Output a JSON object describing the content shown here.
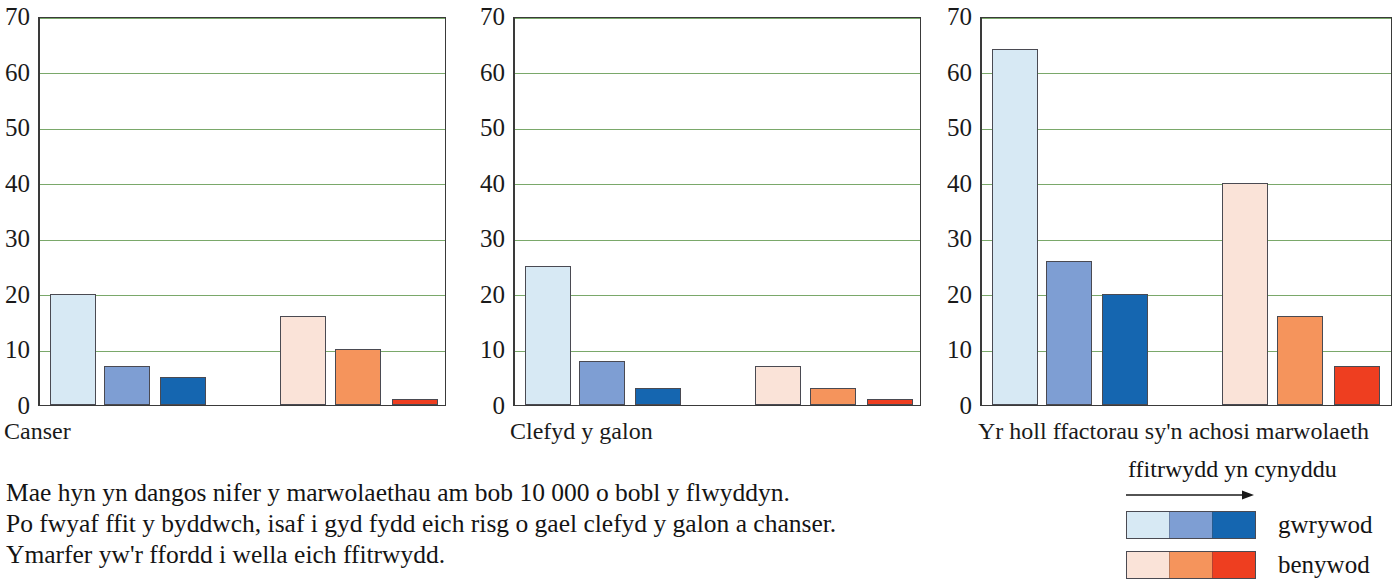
{
  "chart_data": [
    {
      "type": "bar",
      "title": "Canser",
      "xlabel": "",
      "ylabel": "",
      "ylim": [
        0,
        70
      ],
      "ytick_labels": [
        "70",
        "60",
        "50",
        "40",
        "30",
        "20",
        "10",
        "0"
      ],
      "yticks": [
        70,
        60,
        50,
        40,
        30,
        20,
        10,
        0
      ],
      "grid": true,
      "categories": [
        "gwrywod - ffitrwydd isel",
        "gwrywod - ffitrwydd canolig",
        "gwrywod - ffitrwydd uchel",
        "benywod - ffitrwydd isel",
        "benywod - ffitrwydd canolig",
        "benywod - ffitrwydd uchel"
      ],
      "series": [
        {
          "name": "gwrywod",
          "values": [
            20,
            7,
            5
          ]
        },
        {
          "name": "benywod",
          "values": [
            16,
            10,
            1
          ]
        }
      ],
      "values": [
        20,
        7,
        5,
        16,
        10,
        1
      ],
      "colors": [
        "#d7e9f4",
        "#7e9ed3",
        "#1566b0",
        "#fae3d8",
        "#f5945c",
        "#ee3e20"
      ]
    },
    {
      "type": "bar",
      "title": "Clefyd y galon",
      "xlabel": "",
      "ylabel": "",
      "ylim": [
        0,
        70
      ],
      "ytick_labels": [
        "70",
        "60",
        "50",
        "40",
        "30",
        "20",
        "10",
        "0"
      ],
      "yticks": [
        70,
        60,
        50,
        40,
        30,
        20,
        10,
        0
      ],
      "grid": true,
      "categories": [
        "gwrywod - ffitrwydd isel",
        "gwrywod - ffitrwydd canolig",
        "gwrywod - ffitrwydd uchel",
        "benywod - ffitrwydd isel",
        "benywod - ffitrwydd canolig",
        "benywod - ffitrwydd uchel"
      ],
      "series": [
        {
          "name": "gwrywod",
          "values": [
            25,
            8,
            3
          ]
        },
        {
          "name": "benywod",
          "values": [
            7,
            3,
            1
          ]
        }
      ],
      "values": [
        25,
        8,
        3,
        7,
        3,
        1
      ],
      "colors": [
        "#d7e9f4",
        "#7e9ed3",
        "#1566b0",
        "#fae3d8",
        "#f5945c",
        "#ee3e20"
      ]
    },
    {
      "type": "bar",
      "title": "Yr holl ffactorau sy'n achosi marwolaeth",
      "xlabel": "",
      "ylabel": "",
      "ylim": [
        0,
        70
      ],
      "ytick_labels": [
        "70",
        "60",
        "50",
        "40",
        "30",
        "20",
        "10",
        "0"
      ],
      "yticks": [
        70,
        60,
        50,
        40,
        30,
        20,
        10,
        0
      ],
      "grid": true,
      "categories": [
        "gwrywod - ffitrwydd isel",
        "gwrywod - ffitrwydd canolig",
        "gwrywod - ffitrwydd uchel",
        "benywod - ffitrwydd isel",
        "benywod - ffitrwydd canolig",
        "benywod - ffitrwydd uchel"
      ],
      "series": [
        {
          "name": "gwrywod",
          "values": [
            64,
            26,
            20
          ]
        },
        {
          "name": "benywod",
          "values": [
            40,
            16,
            7
          ]
        }
      ],
      "values": [
        64,
        26,
        20,
        40,
        16,
        7
      ],
      "colors": [
        "#d7e9f4",
        "#7e9ed3",
        "#1566b0",
        "#fae3d8",
        "#f5945c",
        "#ee3e20"
      ]
    }
  ],
  "charts": {
    "panel1": {
      "caption": "Canser",
      "ticks": [
        "70",
        "60",
        "50",
        "40",
        "30",
        "20",
        "10",
        "0"
      ]
    },
    "panel2": {
      "caption": "Clefyd y galon",
      "ticks": [
        "70",
        "60",
        "50",
        "40",
        "30",
        "20",
        "10",
        "0"
      ]
    },
    "panel3": {
      "caption": "Yr holl ffactorau sy'n achosi marwolaeth",
      "ticks": [
        "70",
        "60",
        "50",
        "40",
        "30",
        "20",
        "10",
        "0"
      ]
    }
  },
  "caption_text": {
    "line1": "Mae hyn yn dangos nifer y marwolaethau am bob 10 000 o bobl y flwyddyn.",
    "line2": "Po fwyaf ffit y byddwch, isaf i gyd fydd eich risg o gael clefyd y galon a chanser.",
    "line3": "Ymarfer yw'r ffordd i wella eich ffitrwydd."
  },
  "legend": {
    "title": "ffitrwydd yn cynyddu",
    "arrow_icon": "right-arrow-icon",
    "rows": [
      {
        "label": "gwrywod",
        "colors": [
          "#d7e9f4",
          "#7e9ed3",
          "#1566b0"
        ]
      },
      {
        "label": "benywod",
        "colors": [
          "#fae3d8",
          "#f5945c",
          "#ee3e20"
        ]
      }
    ]
  },
  "palette": {
    "gridline": "#7aa86a",
    "axis": "#2b2b2b",
    "text": "#141414",
    "male_low": "#d7e9f4",
    "male_mid": "#7e9ed3",
    "male_high": "#1566b0",
    "female_low": "#fae3d8",
    "female_mid": "#f5945c",
    "female_high": "#ee3e20"
  }
}
